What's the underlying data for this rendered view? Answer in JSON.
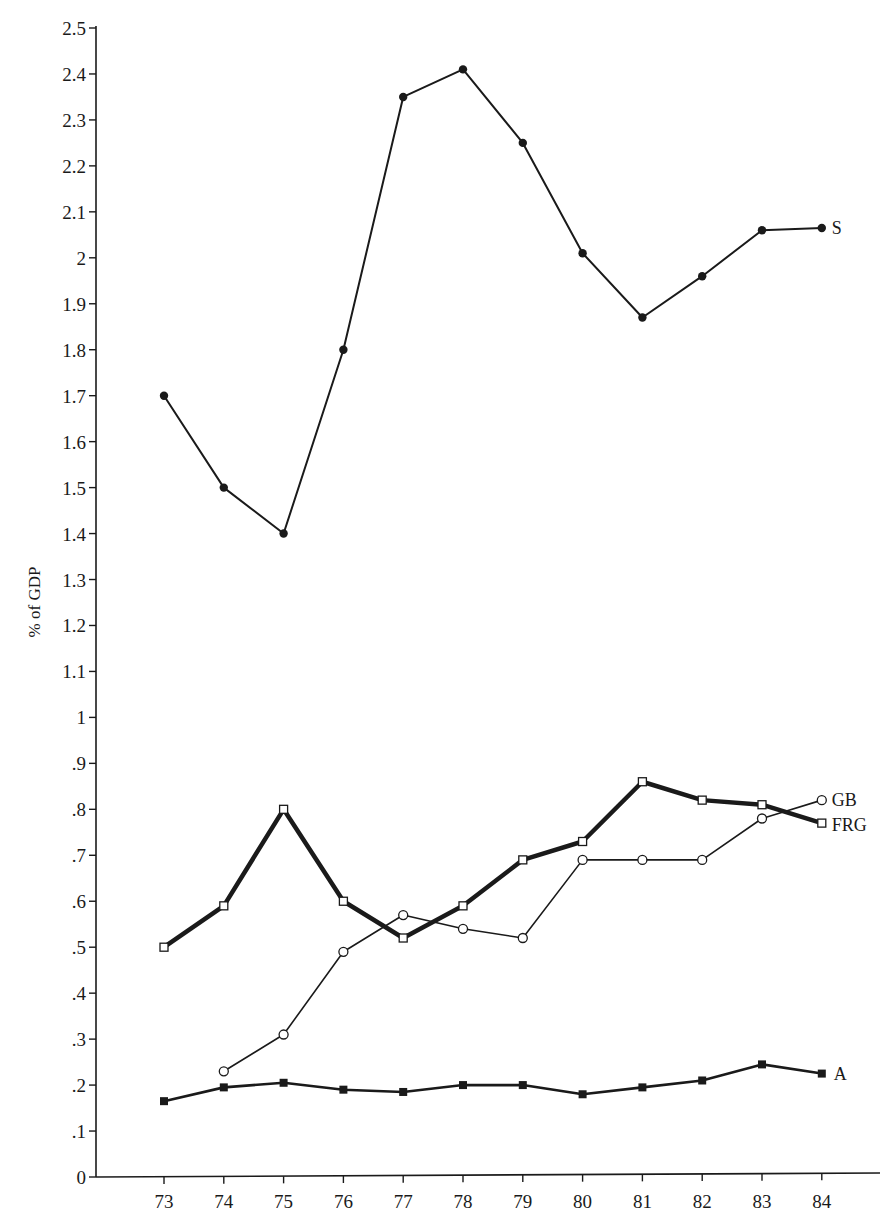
{
  "chart_data": {
    "type": "line",
    "title": "",
    "xlabel": "",
    "ylabel": "% of GDP",
    "ylim": [
      0,
      2.5
    ],
    "grid": false,
    "legend_position": "inline-right-end",
    "x": [
      "73",
      "74",
      "75",
      "76",
      "77",
      "78",
      "79",
      "80",
      "81",
      "82",
      "83",
      "84"
    ],
    "yticks": [
      "0",
      ".1",
      ".2",
      ".3",
      ".4",
      ".5",
      ".6",
      ".7",
      ".8",
      ".9",
      "1",
      "1.1",
      "1.2",
      "1.3",
      "1.4",
      "1.5",
      "1.6",
      "1.7",
      "1.8",
      "1.9",
      "2",
      "2.1",
      "2.2",
      "2.3",
      "2.4",
      "2.5"
    ],
    "series": [
      {
        "name": "S",
        "marker": "filled-circle",
        "line_width": 2,
        "values": [
          1.7,
          1.5,
          1.4,
          1.8,
          2.35,
          2.41,
          2.25,
          2.01,
          1.87,
          1.96,
          2.06,
          2.065
        ]
      },
      {
        "name": "GB",
        "marker": "open-circle",
        "line_width": 1.6,
        "values": [
          null,
          0.23,
          0.31,
          0.49,
          0.57,
          0.54,
          0.52,
          0.69,
          0.69,
          0.69,
          0.78,
          0.82
        ]
      },
      {
        "name": "FRG",
        "marker": "open-square",
        "line_width": 4.5,
        "values": [
          0.5,
          0.59,
          0.8,
          0.6,
          0.52,
          0.59,
          0.69,
          0.73,
          0.86,
          0.82,
          0.81,
          0.77
        ]
      },
      {
        "name": "A",
        "marker": "filled-square",
        "line_width": 2.6,
        "values": [
          0.165,
          0.195,
          0.205,
          0.19,
          0.185,
          0.2,
          0.2,
          0.18,
          0.195,
          0.21,
          0.245,
          0.225
        ]
      }
    ]
  },
  "colors": {
    "ink": "#1a1a1a",
    "background": "#ffffff"
  }
}
